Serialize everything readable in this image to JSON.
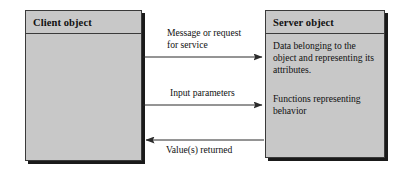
{
  "diagram": {
    "background_color": "#ffffff",
    "box_fill_color": "#c8c8c8",
    "box_border_color": "#3a3a3a",
    "shadow_color": "#1a1a1a",
    "arrow_color": "#2b2b2b"
  },
  "client": {
    "header_label": "Client object",
    "body_text": ""
  },
  "server": {
    "header_label": "Server object",
    "body_line_1": "Data belonging to the\nobject and representing\nits attributes.",
    "body_line_2": "Functions representing\nbehavior"
  },
  "arrows": {
    "request": {
      "label": "Message or request\nfor service",
      "direction": "client-to-server"
    },
    "input": {
      "label": "Input parameters",
      "direction": "client-to-server"
    },
    "returned": {
      "label": "Value(s) returned",
      "direction": "server-to-client"
    }
  }
}
